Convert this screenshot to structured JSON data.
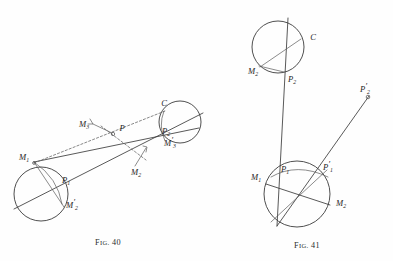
{
  "page": {
    "background_color": "#fefefe",
    "ink_color": "#3b3b3b",
    "type": "book-plate-geometric-figures"
  },
  "figures": [
    {
      "id": "fig-40",
      "caption_prefix": "F",
      "caption_smallcaps": "IG.",
      "caption_number": "40",
      "caption_full": "FIG. 40",
      "labels": [
        {
          "key": "m1",
          "base": "M",
          "sub": "1",
          "prime": false,
          "text": "M1"
        },
        {
          "key": "p1",
          "base": "P",
          "sub": "1",
          "prime": false,
          "text": "P1"
        },
        {
          "key": "m2prime_l",
          "base": "M",
          "sub": "2",
          "prime": true,
          "text": "M'2"
        },
        {
          "key": "m3",
          "base": "M",
          "sub": "3",
          "prime": false,
          "text": "M3"
        },
        {
          "key": "p",
          "base": "P",
          "sub": "",
          "prime": false,
          "text": "P"
        },
        {
          "key": "m2",
          "base": "M",
          "sub": "2",
          "prime": false,
          "text": "M2"
        },
        {
          "key": "c",
          "base": "C",
          "sub": "",
          "prime": false,
          "text": "C"
        },
        {
          "key": "p2",
          "base": "P",
          "sub": "2",
          "prime": false,
          "text": "P2"
        },
        {
          "key": "m2prime_r",
          "base": "M",
          "sub": "3",
          "prime": true,
          "text": "M'3"
        }
      ]
    },
    {
      "id": "fig-41",
      "caption_prefix": "F",
      "caption_smallcaps": "IG.",
      "caption_number": "41",
      "caption_full": "FIG. 41",
      "labels": [
        {
          "key": "c",
          "base": "C",
          "sub": "",
          "prime": false,
          "text": "C"
        },
        {
          "key": "m2_top",
          "base": "M",
          "sub": "2",
          "prime": false,
          "text": "M2"
        },
        {
          "key": "p2",
          "base": "P",
          "sub": "2",
          "prime": false,
          "text": "P2"
        },
        {
          "key": "p2prime",
          "base": "P",
          "sub": "2",
          "prime": true,
          "text": "P'2"
        },
        {
          "key": "m1",
          "base": "M",
          "sub": "1",
          "prime": false,
          "text": "M1"
        },
        {
          "key": "p1",
          "base": "P",
          "sub": "1",
          "prime": false,
          "text": "P1"
        },
        {
          "key": "p1prime",
          "base": "P",
          "sub": "1",
          "prime": true,
          "text": "P'1"
        },
        {
          "key": "m2_bot",
          "base": "M",
          "sub": "2",
          "prime": false,
          "text": "M2"
        }
      ]
    }
  ]
}
